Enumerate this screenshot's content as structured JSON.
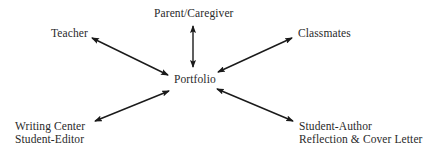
{
  "diagram": {
    "center": {
      "label": "Portfolio"
    },
    "nodes": [
      {
        "id": "parent",
        "lines": [
          "Parent/Caregiver"
        ]
      },
      {
        "id": "teacher",
        "lines": [
          "Teacher"
        ]
      },
      {
        "id": "classmates",
        "lines": [
          "Classmates"
        ]
      },
      {
        "id": "writing_center",
        "lines": [
          "Writing Center",
          "Student-Editor"
        ]
      },
      {
        "id": "student_author",
        "lines": [
          "Student-Author",
          "Reflection & Cover Letter"
        ]
      }
    ],
    "edges": [
      {
        "from": "Portfolio",
        "to": "Parent/Caregiver",
        "direction": "bidirectional"
      },
      {
        "from": "Portfolio",
        "to": "Teacher",
        "direction": "bidirectional"
      },
      {
        "from": "Portfolio",
        "to": "Classmates",
        "direction": "bidirectional"
      },
      {
        "from": "Portfolio",
        "to": "Writing Center Student-Editor",
        "direction": "bidirectional"
      },
      {
        "from": "Portfolio",
        "to": "Student-Author Reflection & Cover Letter",
        "direction": "bidirectional"
      }
    ],
    "colors": {
      "text": "#2a2a2a",
      "arrow": "#1a1a1a",
      "background": "#ffffff"
    }
  }
}
